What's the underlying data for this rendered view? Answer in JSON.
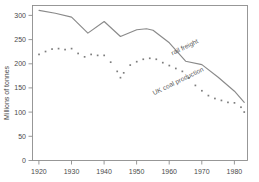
{
  "chart_data": {
    "type": "line",
    "title": "",
    "xlabel": "",
    "ylabel": "Millions of tonnes",
    "xlim": [
      1918,
      1984
    ],
    "ylim": [
      0,
      320
    ],
    "xticks": [
      1920,
      1930,
      1940,
      1950,
      1960,
      1970,
      1980
    ],
    "xtick_labels": [
      "1920",
      "1930",
      "1940",
      "1950",
      "1960",
      "1970",
      "1980"
    ],
    "yticks": [
      0,
      50,
      100,
      150,
      200,
      250,
      300
    ],
    "ytick_labels": [
      "0",
      "50",
      "100",
      "150",
      "200",
      "250",
      "300"
    ],
    "grid": false,
    "legend": "inline-annotations",
    "series": [
      {
        "name": "rail freight",
        "label": "rail freight",
        "style": "solid-line",
        "color": "#8a8a8a",
        "x": [
          1920,
          1925,
          1930,
          1935,
          1940,
          1945,
          1950,
          1953,
          1955,
          1960,
          1965,
          1970,
          1975,
          1980,
          1983
        ],
        "values": [
          310,
          304,
          296,
          263,
          287,
          256,
          270,
          272,
          269,
          243,
          205,
          198,
          172,
          143,
          120
        ]
      },
      {
        "name": "UK coal production",
        "label": "UK coal production",
        "style": "dotted-markers",
        "color": "#7d7d7d",
        "x": [
          1920,
          1922,
          1924,
          1926,
          1928,
          1930,
          1932,
          1934,
          1936,
          1938,
          1940,
          1942,
          1944,
          1945,
          1946,
          1948,
          1950,
          1952,
          1954,
          1956,
          1958,
          1960,
          1962,
          1964,
          1966,
          1968,
          1970,
          1972,
          1974,
          1976,
          1978,
          1980,
          1982,
          1983
        ],
        "values": [
          219,
          225,
          230,
          231,
          229,
          231,
          221,
          214,
          219,
          217,
          217,
          203,
          184,
          171,
          181,
          197,
          204,
          209,
          211,
          209,
          202,
          196,
          190,
          184,
          170,
          155,
          144,
          134,
          128,
          124,
          120,
          119,
          110,
          100
        ]
      }
    ],
    "annotations": [
      {
        "text": "rail freight",
        "x": 1965,
        "y": 230,
        "rotation": -26
      },
      {
        "text": "UK coal production",
        "x": 1963,
        "y": 160,
        "rotation": -26,
        "footnote_marker": "*"
      }
    ]
  }
}
